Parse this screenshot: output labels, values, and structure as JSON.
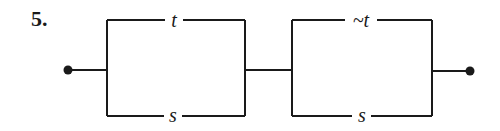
{
  "problem": {
    "number": "5."
  },
  "diagram": {
    "type": "switching-circuit",
    "blocks": [
      {
        "name": "block-1",
        "top_label": "t",
        "bottom_label": "s"
      },
      {
        "name": "block-2",
        "top_label": "~t",
        "bottom_label": "s"
      }
    ],
    "terminals": [
      "left",
      "right"
    ],
    "line_color": "#1a1a1a"
  }
}
